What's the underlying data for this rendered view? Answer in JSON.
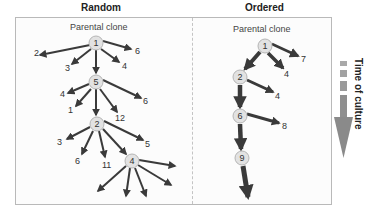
{
  "panels": {
    "random": {
      "title": "Random",
      "subtitle": "Parental clone",
      "nodes": [
        {
          "id": "r1",
          "label": "1",
          "x": 96,
          "y": 43
        },
        {
          "id": "r5",
          "label": "5",
          "x": 96,
          "y": 82
        },
        {
          "id": "r2",
          "label": "2",
          "x": 97,
          "y": 124
        },
        {
          "id": "r4",
          "label": "4",
          "x": 132,
          "y": 161
        }
      ],
      "edges": [
        {
          "from": [
            90,
            45
          ],
          "to": [
            40,
            55
          ],
          "label": "2",
          "lx": 34,
          "ly": 56
        },
        {
          "from": [
            91,
            49
          ],
          "to": [
            72,
            64
          ],
          "label": "3",
          "lx": 65,
          "ly": 71
        },
        {
          "from": [
            96,
            50
          ],
          "to": [
            96,
            73
          ],
          "label": "",
          "lx": 0,
          "ly": 0
        },
        {
          "from": [
            101,
            49
          ],
          "to": [
            119,
            62
          ],
          "label": "4",
          "lx": 122,
          "ly": 69
        },
        {
          "from": [
            103,
            41
          ],
          "to": [
            131,
            49
          ],
          "label": "6",
          "lx": 135,
          "ly": 54
        },
        {
          "from": [
            89,
            84
          ],
          "to": [
            68,
            93
          ],
          "label": "4",
          "lx": 60,
          "ly": 97
        },
        {
          "from": [
            91,
            89
          ],
          "to": [
            76,
            106
          ],
          "label": "1",
          "lx": 68,
          "ly": 113
        },
        {
          "from": [
            96,
            89
          ],
          "to": [
            96,
            115
          ],
          "label": "",
          "lx": 0,
          "ly": 0
        },
        {
          "from": [
            100,
            89
          ],
          "to": [
            117,
            112
          ],
          "label": "12",
          "lx": 115,
          "ly": 121
        },
        {
          "from": [
            103,
            80
          ],
          "to": [
            141,
            98
          ],
          "label": "6",
          "lx": 143,
          "ly": 104
        },
        {
          "from": [
            90,
            127
          ],
          "to": [
            67,
            139
          ],
          "label": "3",
          "lx": 57,
          "ly": 145
        },
        {
          "from": [
            93,
            131
          ],
          "to": [
            82,
            154
          ],
          "label": "6",
          "lx": 75,
          "ly": 164
        },
        {
          "from": [
            99,
            131
          ],
          "to": [
            105,
            157
          ],
          "label": "11",
          "lx": 102,
          "ly": 168
        },
        {
          "from": [
            103,
            129
          ],
          "to": [
            126,
            154
          ],
          "label": "",
          "lx": 0,
          "ly": 0
        },
        {
          "from": [
            104,
            121
          ],
          "to": [
            143,
            140
          ],
          "label": "5",
          "lx": 145,
          "ly": 147
        },
        {
          "from": [
            126,
            166
          ],
          "to": [
            98,
            191
          ],
          "label": "",
          "lx": 0,
          "ly": 0
        },
        {
          "from": [
            130,
            168
          ],
          "to": [
            126,
            196
          ],
          "label": "",
          "lx": 0,
          "ly": 0
        },
        {
          "from": [
            135,
            168
          ],
          "to": [
            146,
            196
          ],
          "label": "",
          "lx": 0,
          "ly": 0
        },
        {
          "from": [
            138,
            165
          ],
          "to": [
            171,
            185
          ],
          "label": "",
          "lx": 0,
          "ly": 0
        },
        {
          "from": [
            139,
            160
          ],
          "to": [
            175,
            166
          ],
          "label": "",
          "lx": 0,
          "ly": 0
        }
      ]
    },
    "ordered": {
      "title": "Ordered",
      "subtitle": "Parental clone",
      "nodes": [
        {
          "id": "o1",
          "label": "1",
          "x": 265,
          "y": 46
        },
        {
          "id": "o2",
          "label": "2",
          "x": 240,
          "y": 77
        },
        {
          "id": "o6",
          "label": "6",
          "x": 240,
          "y": 116
        },
        {
          "id": "o9",
          "label": "9",
          "x": 242,
          "y": 158
        }
      ],
      "edges": [
        {
          "from": [
            260,
            52
          ],
          "to": [
            245,
            69
          ],
          "label": "",
          "lx": 0,
          "ly": 0,
          "w": 4
        },
        {
          "from": [
            268,
            53
          ],
          "to": [
            283,
            68
          ],
          "label": "4",
          "lx": 284,
          "ly": 77,
          "w": 3.5
        },
        {
          "from": [
            272,
            44
          ],
          "to": [
            298,
            56
          ],
          "label": "7",
          "lx": 301,
          "ly": 62,
          "w": 2.5
        },
        {
          "from": [
            240,
            85
          ],
          "to": [
            240,
            107
          ],
          "label": "",
          "lx": 0,
          "ly": 0,
          "w": 4.5
        },
        {
          "from": [
            247,
            80
          ],
          "to": [
            273,
            92
          ],
          "label": "4",
          "lx": 275,
          "ly": 99,
          "w": 3
        },
        {
          "from": [
            240,
            124
          ],
          "to": [
            241,
            149
          ],
          "label": "",
          "lx": 0,
          "ly": 0,
          "w": 4.5
        },
        {
          "from": [
            247,
            114
          ],
          "to": [
            279,
            123
          ],
          "label": "8",
          "lx": 282,
          "ly": 129,
          "w": 3
        },
        {
          "from": [
            243,
            166
          ],
          "to": [
            248,
            197
          ],
          "label": "",
          "lx": 0,
          "ly": 0,
          "w": 5
        }
      ]
    }
  },
  "legend": {
    "label": "Time of culture",
    "icon": "down-arrow-icon",
    "color": "#8a8a8a"
  },
  "colors": {
    "arrow": "#3a3a3a",
    "node_fill": "#e2e2e2",
    "node_stroke": "#b5b5b5",
    "frame": "#b9b9b9"
  }
}
